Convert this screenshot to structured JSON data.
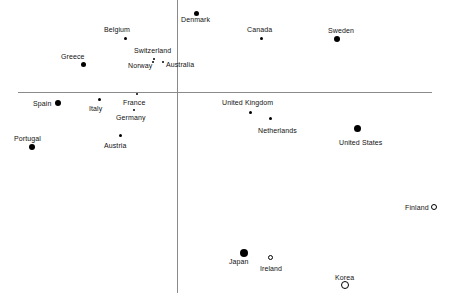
{
  "chart_data": {
    "type": "scatter",
    "title": "",
    "subtitle": "",
    "xlabel": "",
    "ylabel": "",
    "grid": false,
    "legend": "none",
    "axes": {
      "x_axis_line_y_px": 92,
      "x_axis_x_start_px": 18,
      "x_axis_x_end_px": 432,
      "y_axis_line_x_px": 177,
      "y_axis_y_start_px": 0,
      "y_axis_y_end_px": 293,
      "origin_px": [
        177,
        92
      ],
      "note": "Unlabeled crossed axes; quadrant scatter plot of countries"
    },
    "marker_styles": {
      "filled": "solid black circle",
      "open": "white circle with black outline"
    },
    "points": [
      {
        "label": "Denmark",
        "x_px": 196,
        "y_px": 13,
        "size_px": 5,
        "style": "filled",
        "label_x_px": 181,
        "label_y_px": 16,
        "label_anchor": "start"
      },
      {
        "label": "Belgium",
        "x_px": 125,
        "y_px": 38,
        "size_px": 3,
        "style": "filled",
        "label_x_px": 104,
        "label_y_px": 26,
        "label_anchor": "start"
      },
      {
        "label": "Canada",
        "x_px": 261,
        "y_px": 38,
        "size_px": 3,
        "style": "filled",
        "label_x_px": 247,
        "label_y_px": 26,
        "label_anchor": "start"
      },
      {
        "label": "Sweden",
        "x_px": 337,
        "y_px": 39,
        "size_px": 6,
        "style": "filled",
        "label_x_px": 328,
        "label_y_px": 27,
        "label_anchor": "start"
      },
      {
        "label": "Greece",
        "x_px": 83,
        "y_px": 64,
        "size_px": 5,
        "style": "filled",
        "label_x_px": 61,
        "label_y_px": 53,
        "label_anchor": "start"
      },
      {
        "label": "Switzerland",
        "x_px": 154,
        "y_px": 59,
        "size_px": 2,
        "style": "filled",
        "label_x_px": 134,
        "label_y_px": 47,
        "label_anchor": "start"
      },
      {
        "label": "Norway",
        "x_px": 153,
        "y_px": 62,
        "size_px": 2,
        "style": "filled",
        "label_x_px": 128,
        "label_y_px": 62,
        "label_anchor": "start"
      },
      {
        "label": "Australia",
        "x_px": 163,
        "y_px": 62,
        "size_px": 2,
        "style": "filled",
        "label_x_px": 166,
        "label_y_px": 61,
        "label_anchor": "start"
      },
      {
        "label": "Spain",
        "x_px": 58,
        "y_px": 103,
        "size_px": 6,
        "style": "filled",
        "label_x_px": 33,
        "label_y_px": 100,
        "label_anchor": "start"
      },
      {
        "label": "Italy",
        "x_px": 99,
        "y_px": 99,
        "size_px": 3,
        "style": "filled",
        "label_x_px": 89,
        "label_y_px": 105,
        "label_anchor": "start"
      },
      {
        "label": "France",
        "x_px": 137,
        "y_px": 94,
        "size_px": 2,
        "style": "filled",
        "label_x_px": 123,
        "label_y_px": 99,
        "label_anchor": "start"
      },
      {
        "label": "Germany",
        "x_px": 134,
        "y_px": 110,
        "size_px": 2,
        "style": "filled",
        "label_x_px": 116,
        "label_y_px": 114,
        "label_anchor": "start"
      },
      {
        "label": "United Kingdom",
        "x_px": 250,
        "y_px": 112,
        "size_px": 3,
        "style": "filled",
        "label_x_px": 222,
        "label_y_px": 99,
        "label_anchor": "start"
      },
      {
        "label": "Netherlands",
        "x_px": 270,
        "y_px": 118,
        "size_px": 3,
        "style": "filled",
        "label_x_px": 258,
        "label_y_px": 127,
        "label_anchor": "start"
      },
      {
        "label": "United States",
        "x_px": 357,
        "y_px": 128,
        "size_px": 7,
        "style": "filled",
        "label_x_px": 339,
        "label_y_px": 139,
        "label_anchor": "start"
      },
      {
        "label": "Portugal",
        "x_px": 32,
        "y_px": 147,
        "size_px": 6,
        "style": "filled",
        "label_x_px": 14,
        "label_y_px": 135,
        "label_anchor": "start"
      },
      {
        "label": "Austria",
        "x_px": 120,
        "y_px": 135,
        "size_px": 3,
        "style": "filled",
        "label_x_px": 104,
        "label_y_px": 142,
        "label_anchor": "start"
      },
      {
        "label": "Finland",
        "x_px": 434,
        "y_px": 207,
        "size_px": 6,
        "style": "open",
        "label_x_px": 405,
        "label_y_px": 204,
        "label_anchor": "start"
      },
      {
        "label": "Japan",
        "x_px": 244,
        "y_px": 253,
        "size_px": 8,
        "style": "filled",
        "label_x_px": 229,
        "label_y_px": 258,
        "label_anchor": "start"
      },
      {
        "label": "Ireland",
        "x_px": 270,
        "y_px": 257,
        "size_px": 5,
        "style": "open",
        "label_x_px": 260,
        "label_y_px": 265,
        "label_anchor": "start"
      },
      {
        "label": "Korea",
        "x_px": 345,
        "y_px": 285,
        "size_px": 8,
        "style": "open",
        "label_x_px": 335,
        "label_y_px": 274,
        "label_anchor": "start"
      }
    ],
    "colors": {
      "marker_fill": "#000000",
      "marker_stroke": "#000000",
      "axis": "#8a8a8a",
      "text": "#111111",
      "background": "#ffffff"
    }
  }
}
